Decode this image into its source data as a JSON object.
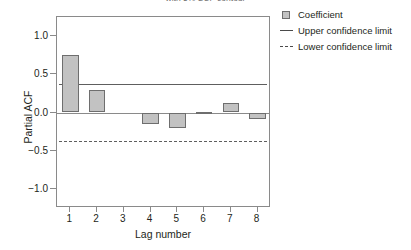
{
  "chart_data": {
    "type": "bar",
    "title": "with 5% SCF contour",
    "xlabel": "Lag number",
    "ylabel": "Partial ACF",
    "categories": [
      "1",
      "2",
      "3",
      "4",
      "5",
      "6",
      "7",
      "8"
    ],
    "values": [
      0.755,
      0.29,
      0.0,
      -0.145,
      -0.2,
      0.01,
      0.12,
      -0.09
    ],
    "series": [
      {
        "name": "Coefficient",
        "values": [
          0.755,
          0.29,
          0.0,
          -0.145,
          -0.2,
          0.01,
          0.12,
          -0.09
        ]
      }
    ],
    "ylim": [
      -1.25,
      1.25
    ],
    "yticks": [
      1.0,
      0.5,
      0.0,
      -0.5,
      -1.0
    ],
    "ytick_labels": [
      "1.0",
      "0.5",
      "0.0",
      "−0.5",
      "−1.0"
    ],
    "xticks": [
      1,
      2,
      3,
      4,
      5,
      6,
      7,
      8
    ],
    "grid": false,
    "legend_position": "right-top",
    "annotations": {
      "upper_confidence_limit": 0.367,
      "lower_confidence_limit": -0.367,
      "zero_line": 0.0
    },
    "legend": [
      {
        "label": "Coefficient",
        "key": "filled-square",
        "color": "#c2c2c2"
      },
      {
        "label": "Upper confidence limit",
        "key": "solid-line",
        "color": "#4a4a4a"
      },
      {
        "label": "Lower confidence limit",
        "key": "dashed-line",
        "color": "#4a4a4a"
      }
    ],
    "colors": {
      "bar_fill": "#c2c2c2",
      "bar_border": "#6e6e6e",
      "axis": "#8a8a8a",
      "limit_line": "#5e5e5e",
      "text": "#231f20"
    }
  },
  "axis": {
    "y_labels": [
      "1.0",
      "0.5",
      "0.0",
      "−0.5",
      "−1.0"
    ],
    "x_labels": [
      "1",
      "2",
      "3",
      "4",
      "5",
      "6",
      "7",
      "8"
    ],
    "y_title": "Partial ACF",
    "x_title": "Lag number"
  },
  "legend": {
    "coefficient": "Coefficient",
    "upper": "Upper confidence limit",
    "lower": "Lower confidence limit"
  },
  "title": "with 5% SCF contour"
}
